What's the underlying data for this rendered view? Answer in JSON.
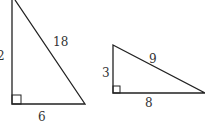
{
  "triangles": [
    {
      "name": "left-triangle",
      "labels": {
        "vertical_leg": "2",
        "hypotenuse": "18",
        "base": "6"
      }
    },
    {
      "name": "right-triangle",
      "labels": {
        "vertical_leg": "3",
        "hypotenuse": "9",
        "base": "8"
      }
    }
  ],
  "colors": {
    "stroke": "#222222",
    "text": "#333333"
  }
}
